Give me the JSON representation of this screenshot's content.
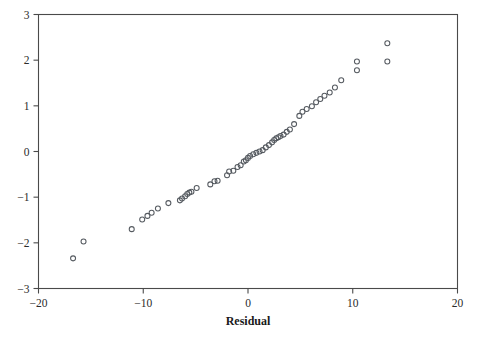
{
  "chart_data": {
    "type": "scatter",
    "title": "",
    "xlabel": "Residual",
    "ylabel": "",
    "xlim": [
      -20,
      20
    ],
    "ylim": [
      -3,
      3
    ],
    "xticks": [
      -20,
      -10,
      0,
      10,
      20
    ],
    "yticks": [
      -3,
      -2,
      -1,
      0,
      1,
      2,
      3
    ],
    "xticklabels": [
      "−20",
      "−10",
      "0",
      "10",
      "20"
    ],
    "yticklabels": [
      "−3",
      "−2",
      "−1",
      "0",
      "1",
      "2",
      "3"
    ],
    "grid": false,
    "legend": null,
    "marker": "open-circle",
    "marker_color": "#555a60",
    "frame_color": "#4a4a4a",
    "background": "#ffffff",
    "series": [
      {
        "name": "residual-normal-scores",
        "x": [
          -16.7,
          -15.7,
          -11.1,
          -10.1,
          -9.6,
          -9.2,
          -8.6,
          -7.6,
          -6.5,
          -6.3,
          -6.0,
          -5.8,
          -5.6,
          -5.4,
          -4.9,
          -3.6,
          -3.2,
          -2.9,
          -2.0,
          -1.8,
          -1.4,
          -1.0,
          -0.7,
          -0.4,
          -0.2,
          0.0,
          0.2,
          0.5,
          0.8,
          1.1,
          1.4,
          1.7,
          2.0,
          2.3,
          2.5,
          2.7,
          2.9,
          3.1,
          3.4,
          3.7,
          4.0,
          4.4,
          4.9,
          5.2,
          5.6,
          6.1,
          6.5,
          6.9,
          7.3,
          7.8,
          8.3,
          8.9,
          10.4,
          13.3
        ],
        "y": [
          -2.34,
          -1.97,
          -1.7,
          -1.49,
          -1.41,
          -1.34,
          -1.25,
          -1.13,
          -1.07,
          -1.03,
          -0.98,
          -0.93,
          -0.9,
          -0.88,
          -0.8,
          -0.72,
          -0.65,
          -0.64,
          -0.52,
          -0.44,
          -0.42,
          -0.34,
          -0.3,
          -0.22,
          -0.19,
          -0.14,
          -0.1,
          -0.06,
          -0.03,
          0.0,
          0.03,
          0.09,
          0.14,
          0.2,
          0.25,
          0.29,
          0.31,
          0.34,
          0.37,
          0.43,
          0.48,
          0.6,
          0.78,
          0.87,
          0.93,
          0.99,
          1.08,
          1.15,
          1.22,
          1.29,
          1.4,
          1.56,
          1.78,
          1.97
        ]
      },
      {
        "name": "residual-normal-scores-tail",
        "x": [
          10.4,
          13.3
        ],
        "y": [
          1.97,
          2.37
        ]
      }
    ]
  },
  "axis": {
    "x_title": "Residual"
  }
}
